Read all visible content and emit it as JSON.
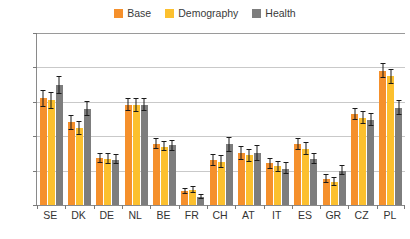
{
  "chart_data": {
    "type": "bar",
    "title": "",
    "subtitle": "",
    "xlabel": "",
    "ylabel": "",
    "ylim": [
      0,
      25
    ],
    "ytick_labels": [
      "0 %",
      "5 %",
      "10 %",
      "15 %",
      "20 %",
      "25 %"
    ],
    "ytick_values": [
      0,
      5,
      10,
      15,
      20,
      25
    ],
    "grid": true,
    "legend_position": "top-center",
    "value_unit": "%",
    "categories": [
      "SE",
      "DK",
      "DE",
      "NL",
      "BE",
      "FR",
      "CH",
      "AT",
      "IT",
      "ES",
      "GR",
      "CZ",
      "PL"
    ],
    "series": [
      {
        "name": "Base",
        "color": "#f5902c",
        "values": [
          15.5,
          12.0,
          6.8,
          14.6,
          8.9,
          2.0,
          6.5,
          7.6,
          6.1,
          8.9,
          3.8,
          13.2,
          19.5
        ],
        "err_low": [
          14.3,
          10.9,
          6.1,
          13.6,
          8.1,
          1.6,
          5.6,
          6.6,
          5.3,
          8.0,
          3.2,
          12.3,
          18.4
        ],
        "err_high": [
          16.7,
          13.1,
          7.6,
          15.6,
          9.7,
          2.5,
          7.4,
          8.6,
          6.9,
          9.8,
          4.5,
          14.1,
          20.6
        ]
      },
      {
        "name": "Demography",
        "color": "#fcc02e",
        "values": [
          15.2,
          11.2,
          6.7,
          14.5,
          8.5,
          2.2,
          6.3,
          7.2,
          5.6,
          8.2,
          3.4,
          12.7,
          18.7
        ],
        "err_low": [
          14.0,
          10.2,
          6.0,
          13.5,
          7.8,
          1.8,
          5.4,
          6.2,
          4.8,
          7.3,
          2.8,
          11.8,
          17.6
        ],
        "err_high": [
          16.4,
          12.2,
          7.5,
          15.5,
          9.3,
          2.7,
          7.2,
          8.2,
          6.4,
          9.1,
          4.1,
          13.6,
          19.8
        ]
      },
      {
        "name": "Health",
        "color": "#7d7d7d",
        "values": [
          17.5,
          14.0,
          6.6,
          14.6,
          8.7,
          1.2,
          8.8,
          7.5,
          5.3,
          6.7,
          5.0,
          12.4,
          14.1
        ],
        "err_low": [
          16.2,
          12.9,
          5.9,
          13.6,
          7.9,
          0.9,
          7.7,
          6.4,
          4.5,
          5.9,
          4.3,
          11.5,
          13.1
        ],
        "err_high": [
          18.8,
          15.1,
          7.4,
          15.6,
          9.5,
          1.6,
          9.9,
          8.7,
          6.2,
          7.6,
          5.8,
          13.4,
          15.2
        ]
      }
    ]
  },
  "legend": {
    "items": [
      {
        "label": "Base",
        "color": "#f5902c"
      },
      {
        "label": "Demography",
        "color": "#fcc02e"
      },
      {
        "label": "Health",
        "color": "#7d7d7d"
      }
    ]
  }
}
